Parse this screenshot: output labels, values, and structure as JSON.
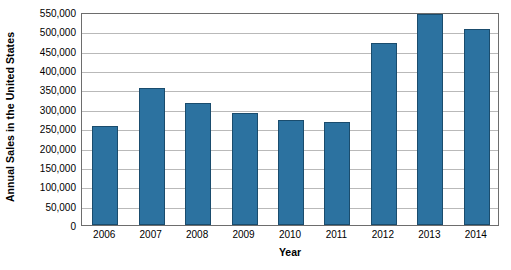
{
  "chart_data": {
    "type": "bar",
    "title": "",
    "subtitle": "",
    "xlabel": "Year",
    "ylabel": "Annual Sales in the United States",
    "categories": [
      "2006",
      "2007",
      "2008",
      "2009",
      "2010",
      "2011",
      "2012",
      "2013",
      "2014"
    ],
    "values": [
      255000,
      353000,
      315000,
      288000,
      272000,
      265000,
      469000,
      545000,
      507000
    ],
    "series": [
      {
        "name": "Annual Sales in the United States",
        "values": [
          255000,
          353000,
          315000,
          288000,
          272000,
          265000,
          469000,
          545000,
          507000
        ]
      }
    ],
    "ylim": [
      0,
      550000
    ],
    "ytick_step": 50000,
    "ytick_labels": [
      "550,000",
      "500,000",
      "450,000",
      "400,000",
      "350,000",
      "300,000",
      "250,000",
      "200,000",
      "150,000",
      "100,000",
      "50,000",
      "0"
    ],
    "ytick_values": [
      550000,
      500000,
      450000,
      400000,
      350000,
      300000,
      250000,
      200000,
      150000,
      100000,
      50000,
      0
    ],
    "grid": true,
    "grid_axis": "y",
    "legend": false,
    "legend_position": "none",
    "bar_color": "#2c72a0",
    "bar_edge_color": "#1a4c6d",
    "gridline_color": "#b9b9b9",
    "axis_color": "#6d6d6d",
    "background_color": "#ffffff"
  }
}
